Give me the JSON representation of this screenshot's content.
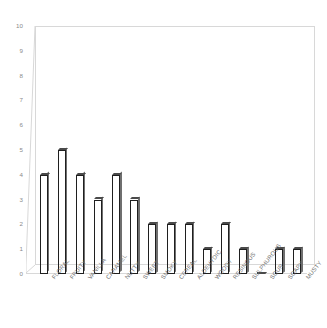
{
  "chart_data": {
    "type": "bar",
    "title": "",
    "subtitle": "",
    "xlabel": "",
    "ylabel": "",
    "ylim": [
      0,
      10
    ],
    "ytick_labels": [
      "10",
      "9",
      "8",
      "7",
      "6",
      "5",
      "4",
      "3",
      "2",
      "1",
      "0"
    ],
    "yticks": [
      10,
      9,
      8,
      7,
      6,
      5,
      4,
      3,
      2,
      1,
      0
    ],
    "grid": false,
    "legend": false,
    "legend_position": "none",
    "style": "3d-column",
    "categories": [
      "FLORAL",
      "FRUITY",
      "VANILLA",
      "CARAMEL",
      "NUTTY",
      "SWEET",
      "SMOKY",
      "CEREAL",
      "ALDEHYDIC",
      "WOODY",
      "RESINOUS",
      "SULPHUROUS",
      "SOUR",
      "SOAPY",
      "MUSTY"
    ],
    "values": [
      4,
      5,
      4,
      3,
      4,
      3,
      2,
      2,
      2,
      1,
      2,
      1,
      0,
      1,
      1
    ],
    "colors": {
      "bar_front": "#3d3d3d",
      "bar_side": "#6f6f6f",
      "bar_top": "#9a9a9a",
      "axis": "#d8d8d8",
      "tick_text": "#8a8a8a",
      "background": "#ffffff"
    }
  }
}
